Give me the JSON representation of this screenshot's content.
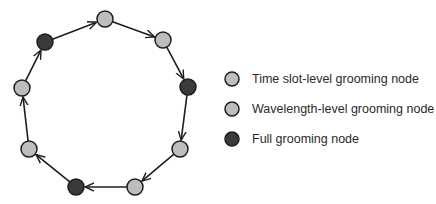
{
  "colors": {
    "light_node": "#bdbdbd",
    "dark_node": "#3a3a3a",
    "stroke": "#1e1e1e",
    "text": "#2a2a2a"
  },
  "ring": {
    "direction": "clockwise",
    "nodes": [
      {
        "id": 1,
        "type": "light",
        "x": 105,
        "y": 19
      },
      {
        "id": 2,
        "type": "light",
        "x": 163,
        "y": 40
      },
      {
        "id": 3,
        "type": "dark",
        "x": 188,
        "y": 87
      },
      {
        "id": 4,
        "type": "light",
        "x": 180,
        "y": 149
      },
      {
        "id": 5,
        "type": "light",
        "x": 135,
        "y": 187
      },
      {
        "id": 6,
        "type": "dark",
        "x": 76,
        "y": 187
      },
      {
        "id": 7,
        "type": "light",
        "x": 29,
        "y": 149
      },
      {
        "id": 8,
        "type": "light",
        "x": 22,
        "y": 88
      },
      {
        "id": 9,
        "type": "dark",
        "x": 45,
        "y": 42
      }
    ]
  },
  "legend": {
    "items": [
      {
        "label": "Time slot-level grooming node",
        "type": "light"
      },
      {
        "label": "Wavelength-level grooming node",
        "type": "light"
      },
      {
        "label": "Full grooming node",
        "type": "dark"
      }
    ]
  }
}
